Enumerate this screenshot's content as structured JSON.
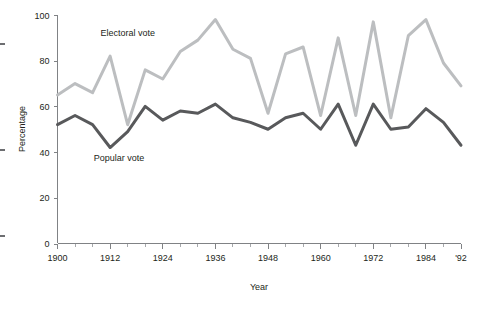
{
  "chart_data": {
    "type": "line",
    "title": "",
    "xlabel": "Year",
    "ylabel": "Percentage",
    "xlim": [
      1900,
      1992
    ],
    "ylim": [
      0,
      100
    ],
    "grid": false,
    "legend_position": "inline-annotations",
    "x_tick_labels": [
      "1900",
      "1912",
      "1924",
      "1936",
      "1948",
      "1960",
      "1972",
      "1984",
      "'92"
    ],
    "x_tick_values": [
      1900,
      1912,
      1924,
      1936,
      1948,
      1960,
      1972,
      1984,
      1992
    ],
    "x_minor_tick_values": [
      1904,
      1908,
      1916,
      1920,
      1928,
      1932,
      1940,
      1944,
      1952,
      1956,
      1964,
      1968,
      1976,
      1980,
      1988
    ],
    "y_tick_labels": [
      "0",
      "20",
      "40",
      "60",
      "80",
      "100"
    ],
    "y_tick_values": [
      0,
      20,
      40,
      60,
      80,
      100
    ],
    "x": [
      1900,
      1904,
      1908,
      1912,
      1916,
      1920,
      1924,
      1928,
      1932,
      1936,
      1940,
      1944,
      1948,
      1952,
      1956,
      1960,
      1964,
      1968,
      1972,
      1976,
      1980,
      1984,
      1988,
      1992
    ],
    "series": [
      {
        "name": "Electoral vote",
        "color": "#bcbec0",
        "label_x": 1916,
        "label_y": 91,
        "values": [
          65,
          70,
          66,
          82,
          52,
          76,
          72,
          84,
          89,
          98,
          85,
          81,
          57,
          83,
          86,
          56,
          90,
          56,
          97,
          55,
          91,
          98,
          79,
          69
        ]
      },
      {
        "name": "Popular vote",
        "color": "#58595b",
        "label_x": 1914,
        "label_y": 36,
        "values": [
          52,
          56,
          52,
          42,
          49,
          60,
          54,
          58,
          57,
          61,
          55,
          53,
          50,
          55,
          57,
          50,
          61,
          43,
          61,
          50,
          51,
          59,
          53,
          43
        ]
      }
    ]
  },
  "axis": {
    "x_title": "Year",
    "y_title": "Percentage"
  }
}
